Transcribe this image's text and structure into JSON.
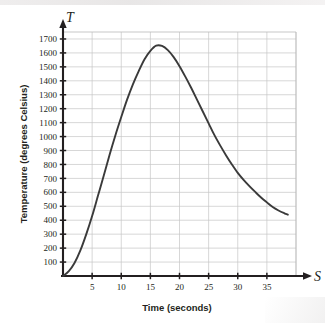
{
  "chart_data": {
    "type": "line",
    "title": "",
    "xlabel": "Time (seconds)",
    "ylabel": "Temperature (degrees Celsius)",
    "x_axis_variable": "S",
    "y_axis_variable": "T",
    "xlim": [
      0,
      40
    ],
    "ylim": [
      0,
      1750
    ],
    "grid": true,
    "legend": "none",
    "x_ticks": [
      5,
      10,
      15,
      20,
      25,
      30,
      35
    ],
    "y_ticks": [
      100,
      200,
      300,
      400,
      500,
      600,
      700,
      800,
      900,
      1000,
      1100,
      1200,
      1300,
      1400,
      1500,
      1600,
      1700
    ],
    "x_tick_labels": [
      "5",
      "10",
      "15",
      "20",
      "25",
      "30",
      "35"
    ],
    "y_tick_labels": [
      "100",
      "200",
      "300",
      "400",
      "500",
      "600",
      "700",
      "800",
      "900",
      "1000",
      "1100",
      "1200",
      "1300",
      "1400",
      "1500",
      "1600",
      "1700"
    ],
    "series": [
      {
        "name": "Temperature",
        "color": "#3a3a3a",
        "x": [
          0,
          1,
          2,
          3,
          4,
          5,
          6,
          7,
          8,
          9,
          10,
          11,
          12,
          13,
          14,
          15,
          16,
          17,
          18,
          19,
          20,
          21,
          22,
          23,
          24,
          25,
          26,
          27,
          28,
          29,
          30,
          31,
          32,
          33,
          34,
          35,
          36,
          37,
          38,
          38.6
        ],
        "y": [
          0,
          35,
          95,
          185,
          300,
          430,
          575,
          720,
          870,
          1010,
          1140,
          1265,
          1375,
          1470,
          1555,
          1615,
          1652,
          1650,
          1620,
          1570,
          1505,
          1430,
          1350,
          1265,
          1180,
          1095,
          1010,
          935,
          865,
          800,
          740,
          690,
          645,
          603,
          563,
          528,
          495,
          470,
          450,
          440
        ]
      }
    ],
    "peak": {
      "x": 16,
      "y": 1652
    },
    "start_point": {
      "x": 0,
      "y": 0
    },
    "end_point": {
      "x": 38.6,
      "y": 440
    }
  }
}
